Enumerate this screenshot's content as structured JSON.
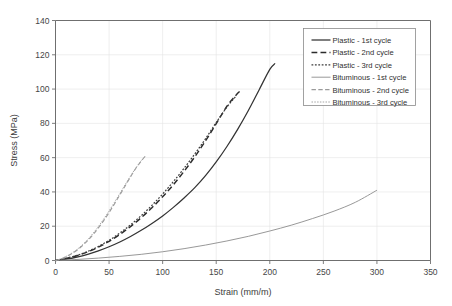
{
  "chart_data": {
    "type": "line",
    "title": "",
    "xlabel": "Strain (mm/m)",
    "ylabel": "Stress (MPa)",
    "xlim": [
      0,
      350
    ],
    "ylim": [
      0,
      140
    ],
    "xticks": [
      0,
      50,
      100,
      150,
      200,
      250,
      300,
      350
    ],
    "yticks": [
      0,
      20,
      40,
      60,
      80,
      100,
      120,
      140
    ],
    "grid": true,
    "legend_position": "top-right",
    "series": [
      {
        "name": "Plastic - 1st cycle",
        "style": "solid",
        "color": "#333333",
        "width": 1.25,
        "points": [
          [
            0,
            0
          ],
          [
            10,
            0.8
          ],
          [
            20,
            2.0
          ],
          [
            30,
            3.6
          ],
          [
            40,
            5.6
          ],
          [
            50,
            8.0
          ],
          [
            60,
            10.8
          ],
          [
            70,
            14.0
          ],
          [
            80,
            17.6
          ],
          [
            90,
            21.6
          ],
          [
            100,
            26.0
          ],
          [
            110,
            31.0
          ],
          [
            120,
            36.5
          ],
          [
            130,
            42.5
          ],
          [
            140,
            49.5
          ],
          [
            150,
            57.5
          ],
          [
            160,
            66.5
          ],
          [
            170,
            76.5
          ],
          [
            180,
            87.5
          ],
          [
            190,
            99.5
          ],
          [
            200,
            111.5
          ],
          [
            205,
            115.0
          ]
        ]
      },
      {
        "name": "Plastic - 2nd cycle",
        "style": "dashed",
        "color": "#2b2b2b",
        "width": 1.45,
        "points": [
          [
            0,
            0
          ],
          [
            10,
            1.2
          ],
          [
            20,
            2.8
          ],
          [
            30,
            5.0
          ],
          [
            40,
            7.8
          ],
          [
            50,
            11.2
          ],
          [
            60,
            15.2
          ],
          [
            70,
            19.8
          ],
          [
            80,
            25.0
          ],
          [
            90,
            30.8
          ],
          [
            100,
            37.2
          ],
          [
            110,
            44.2
          ],
          [
            120,
            52.0
          ],
          [
            130,
            60.5
          ],
          [
            140,
            69.8
          ],
          [
            150,
            79.8
          ],
          [
            160,
            90.0
          ],
          [
            170,
            97.5
          ],
          [
            173,
            99.0
          ]
        ]
      },
      {
        "name": "Plastic - 3rd cycle",
        "style": "dotted",
        "color": "#3b3b3b",
        "width": 1.2,
        "points": [
          [
            0,
            0
          ],
          [
            10,
            1.3
          ],
          [
            20,
            3.0
          ],
          [
            30,
            5.3
          ],
          [
            40,
            8.2
          ],
          [
            50,
            11.8
          ],
          [
            60,
            16.0
          ],
          [
            70,
            20.8
          ],
          [
            80,
            26.2
          ],
          [
            90,
            32.2
          ],
          [
            100,
            38.8
          ],
          [
            110,
            46.0
          ],
          [
            120,
            53.8
          ],
          [
            130,
            62.2
          ],
          [
            140,
            71.0
          ],
          [
            150,
            80.5
          ],
          [
            160,
            89.5
          ],
          [
            168,
            95.5
          ]
        ]
      },
      {
        "name": "Bituminous - 1st cycle",
        "style": "solid",
        "color": "#8c8c8c",
        "width": 0.9,
        "points": [
          [
            0,
            0
          ],
          [
            20,
            0.6
          ],
          [
            40,
            1.4
          ],
          [
            60,
            2.4
          ],
          [
            80,
            3.6
          ],
          [
            100,
            5.1
          ],
          [
            120,
            6.9
          ],
          [
            140,
            9.0
          ],
          [
            160,
            11.4
          ],
          [
            180,
            14.1
          ],
          [
            200,
            17.2
          ],
          [
            220,
            20.6
          ],
          [
            240,
            24.5
          ],
          [
            260,
            28.8
          ],
          [
            280,
            34.0
          ],
          [
            300,
            41.0
          ]
        ]
      },
      {
        "name": "Bituminous - 2nd cycle",
        "style": "dashed",
        "color": "#9a9a9a",
        "width": 1.1,
        "points": [
          [
            0,
            0
          ],
          [
            5,
            0.9
          ],
          [
            10,
            2.2
          ],
          [
            15,
            3.9
          ],
          [
            20,
            6.0
          ],
          [
            25,
            8.6
          ],
          [
            30,
            11.6
          ],
          [
            35,
            15.1
          ],
          [
            40,
            19.0
          ],
          [
            45,
            23.3
          ],
          [
            50,
            28.0
          ],
          [
            55,
            33.0
          ],
          [
            60,
            38.2
          ],
          [
            65,
            43.5
          ],
          [
            70,
            48.8
          ],
          [
            75,
            53.8
          ],
          [
            80,
            58.0
          ],
          [
            84,
            61.0
          ]
        ]
      },
      {
        "name": "Bituminous - 3rd cycle",
        "style": "dotted",
        "color": "#a5a5a5",
        "width": 1.0,
        "points": [
          [
            0,
            0
          ],
          [
            5,
            1.0
          ],
          [
            10,
            2.4
          ],
          [
            15,
            4.2
          ],
          [
            20,
            6.4
          ],
          [
            25,
            9.1
          ],
          [
            30,
            12.2
          ],
          [
            35,
            15.8
          ],
          [
            40,
            19.8
          ],
          [
            45,
            24.2
          ],
          [
            50,
            28.9
          ],
          [
            55,
            33.9
          ],
          [
            60,
            39.0
          ],
          [
            65,
            44.2
          ],
          [
            70,
            49.2
          ],
          [
            75,
            54.0
          ],
          [
            80,
            58.2
          ],
          [
            83,
            60.2
          ]
        ]
      }
    ]
  },
  "legend": {
    "items": [
      "Plastic - 1st cycle",
      "Plastic - 2nd cycle",
      "Plastic - 3rd cycle",
      "Bituminous - 1st cycle",
      "Bituminous - 2nd cycle",
      "Bituminous - 3rd cycle"
    ]
  },
  "axes": {
    "x_title": "Strain (mm/m)",
    "y_title": "Stress (MPa)",
    "x_tick_labels": [
      "0",
      "50",
      "100",
      "150",
      "200",
      "250",
      "300",
      "350"
    ],
    "y_tick_labels": [
      "0",
      "20",
      "40",
      "60",
      "80",
      "100",
      "120",
      "140"
    ]
  }
}
